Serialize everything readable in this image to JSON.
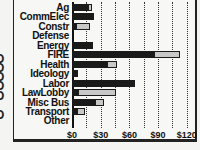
{
  "chart_data": {
    "type": "bar",
    "orientation": "horizontal",
    "stacked": true,
    "title": "",
    "xlabel": "",
    "ylabel": "",
    "categories": [
      "Ag",
      "CommElec",
      "Constr",
      "Defense",
      "Energy",
      "FIRE",
      "Health",
      "Ideology",
      "Labor",
      "LawLobby",
      "Misc Bus",
      "Transport",
      "Other"
    ],
    "series": [
      {
        "name": "dark",
        "color": "#1a1a1a",
        "values": [
          18,
          22,
          5,
          0,
          22,
          87,
          38,
          6,
          66,
          7,
          25,
          6,
          0
        ]
      },
      {
        "name": "light",
        "color": "#c8c8c8",
        "values": [
          3,
          1,
          14,
          0,
          0,
          26,
          9,
          0,
          0,
          39,
          8,
          8,
          0
        ]
      }
    ],
    "x_ticks": [
      "$0",
      "$30",
      "$60",
      "$90",
      "$120"
    ],
    "x_tick_values": [
      0,
      30,
      60,
      90,
      120
    ],
    "xlim": [
      0,
      130
    ],
    "grid": true,
    "legend": "none"
  },
  "edge_glyphs": [
    "O",
    "O",
    "O",
    "O",
    "O",
    "O"
  ]
}
